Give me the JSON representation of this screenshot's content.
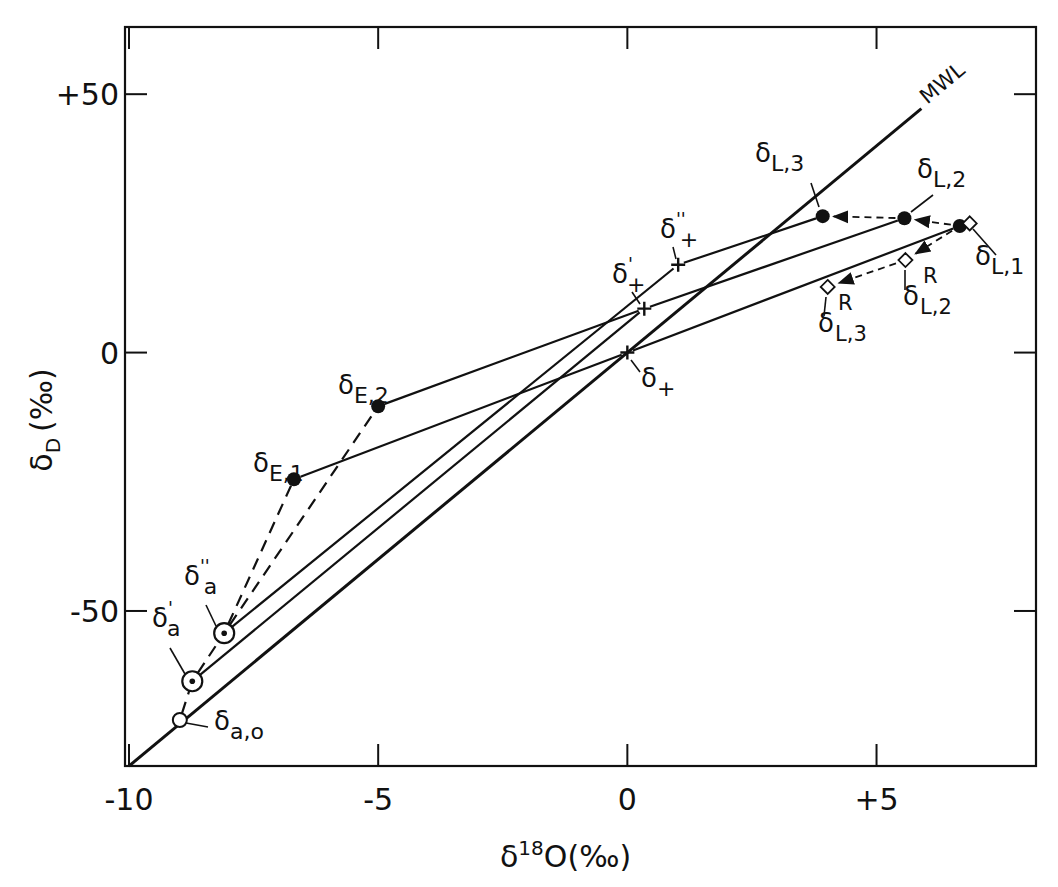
{
  "chart_data": {
    "type": "scatter",
    "title": "",
    "xlabel": "δ18O (‰)",
    "ylabel": "δD (‰)",
    "xlabel_parts": {
      "main": "δ",
      "sup": "18",
      "rest": "O(‰)"
    },
    "ylabel_parts": {
      "main": "δ",
      "sub": "D",
      "rest": "(‰)"
    },
    "xlim": [
      -10,
      8.2
    ],
    "ylim": [
      -80,
      63
    ],
    "grid": false,
    "legend": null,
    "x_ticks": [
      {
        "value": -10,
        "label": "-10"
      },
      {
        "value": -5,
        "label": "-5"
      },
      {
        "value": 0,
        "label": "0"
      },
      {
        "value": 5,
        "label": "+5"
      }
    ],
    "y_ticks": [
      {
        "value": 50,
        "label": "+50"
      },
      {
        "value": 0,
        "label": "0"
      },
      {
        "value": -50,
        "label": "-50"
      }
    ],
    "reference_line": {
      "name": "MWL",
      "label": "MWL",
      "equation": "δD = 8·δ18O",
      "from": [
        -10,
        -80
      ],
      "to": [
        5.9,
        47.2
      ]
    },
    "points": [
      {
        "id": "a0",
        "label": "δ",
        "sub": "a,o",
        "sup": "",
        "x": -8.98,
        "y": -71.1,
        "marker": "open-circle"
      },
      {
        "id": "a1",
        "label": "δ",
        "sub": "a",
        "sup": "'",
        "x": -8.73,
        "y": -63.6,
        "marker": "circled-dot"
      },
      {
        "id": "a2",
        "label": "δ",
        "sub": "a",
        "sup": "''",
        "x": -8.09,
        "y": -54.3,
        "marker": "circled-dot"
      },
      {
        "id": "E1",
        "label": "δ",
        "sub": "E,1",
        "sup": "",
        "x": -6.69,
        "y": -24.5,
        "marker": "filled-circle"
      },
      {
        "id": "E2",
        "label": "δ",
        "sub": "E,2",
        "sup": "",
        "x": -5.0,
        "y": -10.4,
        "marker": "filled-circle"
      },
      {
        "id": "p0",
        "label": "δ",
        "sub": "+",
        "sup": "",
        "x": 0.0,
        "y": 0.0,
        "marker": "plus"
      },
      {
        "id": "p1",
        "label": "δ",
        "sub": "+",
        "sup": "'",
        "x": 0.34,
        "y": 8.5,
        "marker": "plus"
      },
      {
        "id": "p2",
        "label": "δ",
        "sub": "+",
        "sup": "''",
        "x": 1.02,
        "y": 17.0,
        "marker": "plus"
      },
      {
        "id": "L1",
        "label": "δ",
        "sub": "L,1",
        "sup": "",
        "x": 6.67,
        "y": 24.5,
        "marker": "filled-circle"
      },
      {
        "id": "L1R",
        "label": "",
        "sub": "",
        "sup": "",
        "x": 6.87,
        "y": 25.0,
        "marker": "diamond"
      },
      {
        "id": "L2",
        "label": "δ",
        "sub": "L,2",
        "sup": "",
        "x": 5.56,
        "y": 26.0,
        "marker": "filled-circle"
      },
      {
        "id": "L3",
        "label": "δ",
        "sub": "L,3",
        "sup": "",
        "x": 3.92,
        "y": 26.4,
        "marker": "filled-circle"
      },
      {
        "id": "L2R",
        "label": "δ",
        "sub": "L,2",
        "sup": "R",
        "x": 5.58,
        "y": 17.9,
        "marker": "diamond"
      },
      {
        "id": "L3R",
        "label": "δ",
        "sub": "L,3",
        "sup": "R",
        "x": 4.02,
        "y": 12.7,
        "marker": "diamond"
      }
    ],
    "solid_lines": [
      {
        "from": "a2",
        "to": "p2"
      },
      {
        "from": "a1",
        "to": "p1"
      },
      {
        "from": "E2",
        "to": "p1"
      },
      {
        "from": "E1",
        "to": "p0"
      },
      {
        "from": "p2",
        "to": "L3"
      },
      {
        "from": "p1",
        "to": "L2"
      },
      {
        "from": "p0",
        "to": "L1"
      }
    ],
    "dashed_lines": [
      {
        "from": "a0",
        "to": "a1"
      },
      {
        "from": "a1",
        "to": "a2"
      },
      {
        "from": "a2",
        "to": "E1"
      },
      {
        "from": "a2",
        "to": "E2"
      }
    ],
    "dashed_arrows": [
      {
        "from": "L1",
        "to": "L2"
      },
      {
        "from": "L2",
        "to": "L3"
      },
      {
        "from": "L1",
        "to": "L2R"
      },
      {
        "from": "L2R",
        "to": "L3R"
      }
    ],
    "annotations": [
      "MWL",
      "δa,o",
      "δ'a",
      "δ''a",
      "δE,1",
      "δE,2",
      "δ+",
      "δ'+",
      "δ''+",
      "δL,1",
      "δL,2",
      "δL,3",
      "δL,2 R",
      "δL,3 R"
    ]
  },
  "colors": {
    "ink": "#111111",
    "background": "#ffffff"
  }
}
